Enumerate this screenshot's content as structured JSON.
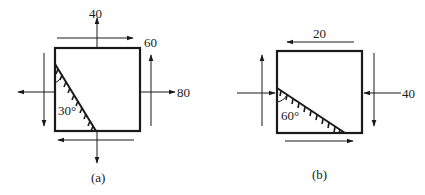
{
  "figures": [
    {
      "id": "a",
      "caption": "(a)",
      "labels": {
        "top_normal": "40",
        "top_shear": "60",
        "right_normal": "80",
        "angle": "30°"
      }
    },
    {
      "id": "b",
      "caption": "(b)",
      "labels": {
        "top_shear": "20",
        "right_normal": "40",
        "angle": "60°"
      }
    }
  ],
  "colors": {
    "stroke": "#1a1a1a",
    "background": "#ffffff"
  }
}
